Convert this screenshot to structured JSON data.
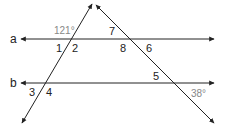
{
  "diagram": {
    "type": "parallel-lines-transversals",
    "lines": {
      "a": {
        "label": "a"
      },
      "b": {
        "label": "b"
      }
    },
    "angle_labels": {
      "n1": "1",
      "n2": "2",
      "n3": "3",
      "n4": "4",
      "n5": "5",
      "n6": "6",
      "n7": "7",
      "n8": "8"
    },
    "given_angles": {
      "top_left": "121°",
      "bottom_right": "38°"
    },
    "colors": {
      "line": "#222222",
      "degree_text": "#888888"
    }
  }
}
